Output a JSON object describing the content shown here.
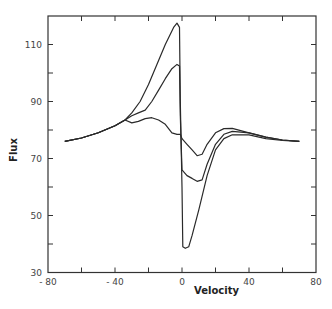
{
  "chart_data": {
    "type": "line",
    "title": "",
    "xlabel": "Velocity",
    "ylabel": "Flux",
    "xlim": [
      -80,
      80
    ],
    "ylim": [
      30,
      120
    ],
    "grid": false,
    "legend": null,
    "x_ticks": [
      -80,
      -40,
      0,
      40,
      80
    ],
    "x_tick_labels": [
      "- 80",
      "- 40",
      "0",
      "40",
      "80"
    ],
    "x_minor_ticks": [
      -60,
      -20,
      20,
      60
    ],
    "y_ticks": [
      30,
      50,
      70,
      90,
      110
    ],
    "y_tick_labels": [
      "30",
      "50",
      "70",
      "90",
      "110"
    ],
    "y_minor_ticks": [
      40,
      60,
      80,
      100
    ],
    "series": [
      {
        "name": "curve-1",
        "points": [
          [
            -70,
            76
          ],
          [
            -60,
            77.2
          ],
          [
            -50,
            79
          ],
          [
            -40,
            81.5
          ],
          [
            -34,
            83.5
          ],
          [
            -30,
            86
          ],
          [
            -25,
            90
          ],
          [
            -20,
            96
          ],
          [
            -15,
            103
          ],
          [
            -10,
            110
          ],
          [
            -5,
            116
          ],
          [
            -3,
            117.5
          ],
          [
            -1.5,
            116
          ],
          [
            -1,
            90
          ],
          [
            0,
            60
          ],
          [
            0.5,
            39
          ],
          [
            2,
            38.5
          ],
          [
            4,
            39
          ],
          [
            6,
            43
          ],
          [
            10,
            52
          ],
          [
            15,
            64
          ],
          [
            20,
            73
          ],
          [
            25,
            77
          ],
          [
            30,
            78.3
          ],
          [
            40,
            78.3
          ],
          [
            50,
            77
          ],
          [
            60,
            76.3
          ],
          [
            70,
            76
          ]
        ]
      },
      {
        "name": "curve-2",
        "points": [
          [
            -70,
            76
          ],
          [
            -60,
            77.2
          ],
          [
            -50,
            79
          ],
          [
            -40,
            81.5
          ],
          [
            -34,
            83.5
          ],
          [
            -30,
            85
          ],
          [
            -26,
            86
          ],
          [
            -22,
            87
          ],
          [
            -18,
            90
          ],
          [
            -14,
            94
          ],
          [
            -10,
            98
          ],
          [
            -6,
            101.5
          ],
          [
            -3,
            103
          ],
          [
            -1.5,
            102.5
          ],
          [
            -1,
            85
          ],
          [
            0,
            66
          ],
          [
            3,
            64
          ],
          [
            6,
            63
          ],
          [
            9,
            62
          ],
          [
            12,
            62.5
          ],
          [
            15,
            68
          ],
          [
            20,
            75
          ],
          [
            25,
            78.5
          ],
          [
            30,
            79.5
          ],
          [
            40,
            79
          ],
          [
            50,
            77.5
          ],
          [
            60,
            76.5
          ],
          [
            70,
            76
          ]
        ]
      },
      {
        "name": "curve-3",
        "points": [
          [
            -70,
            76
          ],
          [
            -60,
            77.2
          ],
          [
            -50,
            79
          ],
          [
            -40,
            81.5
          ],
          [
            -34,
            83.5
          ],
          [
            -30,
            82.5
          ],
          [
            -26,
            83
          ],
          [
            -22,
            84
          ],
          [
            -18,
            84.3
          ],
          [
            -14,
            83.5
          ],
          [
            -10,
            82
          ],
          [
            -6,
            79
          ],
          [
            -3,
            78.5
          ],
          [
            -1,
            78.5
          ],
          [
            0,
            77
          ],
          [
            3,
            75
          ],
          [
            6,
            73
          ],
          [
            9,
            71
          ],
          [
            12,
            71.5
          ],
          [
            15,
            75
          ],
          [
            20,
            79
          ],
          [
            25,
            80.5
          ],
          [
            30,
            80.6
          ],
          [
            40,
            79
          ],
          [
            50,
            77.5
          ],
          [
            60,
            76.5
          ],
          [
            70,
            76
          ]
        ]
      }
    ]
  }
}
